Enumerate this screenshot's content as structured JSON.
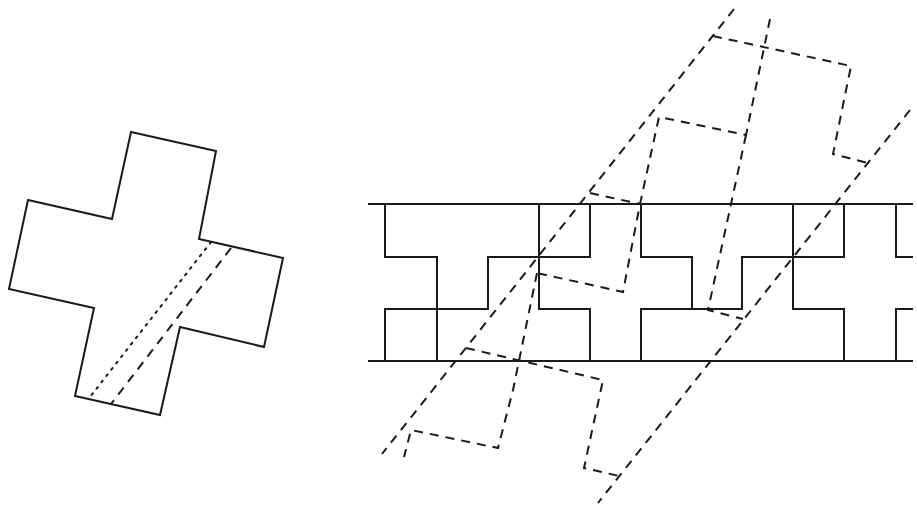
{
  "diagram": {
    "stroke_color": "#1a1a1a",
    "background": "#ffffff",
    "cross": {
      "points": "131,132 216,151 199,239 283,258 264,347 180,327 160,415 75,396 94,308 9,289 28,200 112,219",
      "dotted_cut": {
        "x1": 211,
        "y1": 242,
        "x2": 90,
        "y2": 397
      },
      "dashed_cut": {
        "x1": 231,
        "y1": 248,
        "x2": 111,
        "y2": 404
      }
    },
    "strip": {
      "top_line": {
        "x1": 368,
        "y1": 204,
        "x2": 913,
        "y2": 204
      },
      "bottom_line": {
        "x1": 368,
        "y1": 361,
        "x2": 913,
        "y2": 361
      },
      "tile_outline": "M385,204 V257 H437 V309 H385 V361 M437,361 V309 H488 V257 H539 V204 M539,257 V309 H590 V361 M590,204 V257 H641 V309 H692 V361 M641,204 V257 M641,309 V361 M692,257 V309 M692,309 H742 V257 H793 V204 M793,257 V309 H844 V361 M844,204 V257 H896 V204 M896,309 H913 M896,257 H913 M896,309 V361 M793,309 V257 M742,257 V309"
    },
    "dashed_overlays": {
      "long_lines": [
        {
          "x1": 734,
          "y1": 9,
          "x2": 382,
          "y2": 454
        },
        {
          "x1": 910,
          "y1": 110,
          "x2": 598,
          "y2": 503
        }
      ],
      "upper_cross": "M770,19 L746,135 L659,117 L640,204 L623,292 L537,273 L513,390 L404,457",
      "upper_cross_outer": "M713,36 L851,66 L833,154 L868,163",
      "middle_piece": "M590,193 L640,204 L708,310 M746,135 L708,310 L743,319",
      "lower_cross": "M466,348 L603,380 L584,468 L619,476",
      "lower_inner": "M513,352 L498,448 L411,430 L404,457"
    }
  }
}
